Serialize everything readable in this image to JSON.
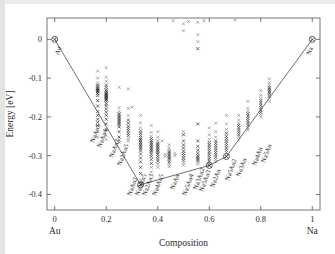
{
  "figure": {
    "background": "#ffffff",
    "frame_color": "#55555a",
    "marker_color": "#6e6e74",
    "hull_color": "#4a4a50"
  },
  "chart_data": {
    "type": "scatter",
    "title": "",
    "xlabel": "Composition",
    "ylabel": "Energy [eV]",
    "xlim": [
      -0.03,
      1.03
    ],
    "ylim": [
      -0.44,
      0.055
    ],
    "grid": false,
    "legend": null,
    "xticks": [
      0,
      0.2,
      0.4,
      0.6,
      0.8,
      1
    ],
    "xtick_labels": [
      "0",
      "0.2",
      "0.4",
      "0.6",
      "0.8",
      "1"
    ],
    "yticks": [
      0,
      -0.1,
      -0.2,
      -0.3,
      -0.4
    ],
    "ytick_labels": [
      "0",
      "-0.1",
      "-0.2",
      "-0.3",
      "-0.4"
    ],
    "x_end_labels": {
      "left": "Au",
      "right": "Na"
    },
    "series": [
      {
        "name": "convex hull",
        "type": "line",
        "x": [
          0.0,
          0.3333,
          0.6,
          0.6667,
          1.0
        ],
        "y": [
          0.0,
          -0.375,
          -0.325,
          -0.302,
          0.0
        ]
      },
      {
        "name": "hull vertices",
        "type": "marker-circle",
        "x": [
          0.0,
          0.3333,
          0.6,
          0.6667,
          1.0
        ],
        "y": [
          0.0,
          -0.375,
          -0.325,
          -0.302,
          0.0
        ],
        "labels": [
          "Au",
          "NaAu2",
          "Na3Au2",
          "Na2Au",
          "Na"
        ]
      },
      {
        "name": "structure energies",
        "type": "marker-x",
        "clusters": [
          {
            "x": 0.1667,
            "label": "NaAu5",
            "values": [
              -0.082,
              -0.1,
              -0.112,
              -0.118,
              -0.122,
              -0.126,
              -0.128,
              -0.13,
              -0.132,
              -0.134,
              -0.136,
              -0.14,
              -0.145,
              -0.158,
              -0.172,
              -0.186,
              -0.196,
              -0.206,
              -0.214,
              -0.222,
              -0.238,
              -0.252
            ]
          },
          {
            "x": 0.2,
            "label": "NaAu4",
            "values": [
              -0.073,
              -0.098,
              -0.108,
              -0.118,
              -0.124,
              -0.13,
              -0.134,
              -0.138,
              -0.14,
              -0.142,
              -0.144,
              -0.146,
              -0.148,
              -0.15,
              -0.152,
              -0.154,
              -0.156,
              -0.16,
              -0.166,
              -0.172,
              -0.18,
              -0.188,
              -0.196,
              -0.206,
              -0.218,
              -0.232,
              -0.248,
              -0.258
            ]
          },
          {
            "x": 0.25,
            "label": "NaAu3",
            "values": [
              -0.124,
              -0.176,
              -0.186,
              -0.192,
              -0.196,
              -0.2,
              -0.204,
              -0.208,
              -0.212,
              -0.216,
              -0.22,
              -0.226,
              -0.238,
              -0.252,
              -0.26,
              -0.266
            ]
          },
          {
            "x": 0.2857,
            "label": "Na2Au5",
            "values": [
              -0.128,
              -0.178,
              -0.196,
              -0.208,
              -0.216,
              -0.224,
              -0.23,
              -0.236,
              -0.242,
              -0.248,
              -0.256,
              -0.262
            ]
          },
          {
            "x": 0.3333,
            "label": "NaAu2",
            "values": [
              -0.196,
              -0.216,
              -0.228,
              -0.236,
              -0.242,
              -0.248,
              -0.254,
              -0.258,
              -0.262,
              -0.266,
              -0.27,
              -0.274,
              -0.278,
              -0.282,
              -0.288,
              -0.296,
              -0.306,
              -0.316,
              -0.33,
              -0.346,
              -0.362,
              -0.375
            ]
          },
          {
            "x": 0.375,
            "label": "Na3Au5",
            "values": [
              -0.222,
              -0.24,
              -0.25,
              -0.256,
              -0.262,
              -0.266,
              -0.27,
              -0.274,
              -0.278,
              -0.282,
              -0.286,
              -0.29,
              -0.296,
              -0.302,
              -0.31,
              -0.32,
              -0.33,
              -0.342
            ]
          },
          {
            "x": 0.4,
            "label": "Na2Au3",
            "values": [
              -0.238,
              -0.252,
              -0.262,
              -0.268,
              -0.272,
              -0.276,
              -0.28,
              -0.284,
              -0.288,
              -0.292,
              -0.296,
              -0.302,
              -0.308,
              -0.314,
              -0.322,
              -0.33
            ]
          },
          {
            "x": 0.4444,
            "label": "Na4Au5",
            "values": [
              -0.272,
              -0.28,
              -0.286,
              -0.29,
              -0.294,
              -0.298,
              -0.302,
              -0.306,
              -0.31,
              -0.316,
              -0.322,
              -0.328
            ]
          },
          {
            "x": 0.5,
            "label": "NaAu",
            "values": [
              0.04,
              0.022,
              -0.238,
              -0.246,
              -0.262,
              -0.272,
              -0.28,
              -0.288,
              -0.294,
              -0.3,
              -0.306,
              -0.312,
              -0.318,
              -0.324
            ]
          },
          {
            "x": 0.5556,
            "label": "Na5Au4",
            "values": [
              0.044,
              0.012,
              -0.006,
              -0.024,
              -0.218,
              -0.262,
              -0.276,
              -0.286,
              -0.294,
              -0.3,
              -0.304,
              -0.308,
              -0.312,
              -0.316,
              -0.322
            ]
          },
          {
            "x": 0.6,
            "label": "Na3Au2",
            "values": [
              -0.228,
              -0.246,
              -0.258,
              -0.266,
              -0.272,
              -0.278,
              -0.284,
              -0.29,
              -0.296,
              -0.302,
              -0.308,
              -0.314,
              -0.32,
              -0.325
            ]
          },
          {
            "x": 0.625,
            "label": "Na5Au3",
            "values": [
              -0.216,
              -0.238,
              -0.252,
              -0.262,
              -0.268,
              -0.274,
              -0.28,
              -0.286,
              -0.292,
              -0.298,
              -0.304,
              -0.31,
              -0.316
            ]
          },
          {
            "x": 0.6667,
            "label": "Na2Au",
            "values": [
              -0.196,
              -0.218,
              -0.232,
              -0.242,
              -0.25,
              -0.256,
              -0.262,
              -0.268,
              -0.274,
              -0.28,
              -0.286,
              -0.292,
              -0.302
            ]
          },
          {
            "x": 0.7143,
            "label": "Na5Au2",
            "values": [
              -0.196,
              -0.208,
              -0.216,
              -0.222,
              -0.228,
              -0.234,
              -0.24,
              -0.246,
              -0.252,
              -0.258
            ]
          },
          {
            "x": 0.75,
            "label": "Na3Au",
            "values": [
              -0.16,
              -0.178,
              -0.186,
              -0.192,
              -0.198,
              -0.204,
              -0.21,
              -0.216,
              -0.222,
              -0.228,
              -0.234
            ]
          },
          {
            "x": 0.8,
            "label": "Na4Au",
            "values": [
              -0.132,
              -0.144,
              -0.152,
              -0.158,
              -0.164,
              -0.17,
              -0.176,
              -0.182,
              -0.188,
              -0.194,
              -0.2
            ]
          },
          {
            "x": 0.8333,
            "label": "Na5Au",
            "values": [
              -0.102,
              -0.112,
              -0.118,
              -0.124,
              -0.128,
              -0.132,
              -0.136,
              -0.14,
              -0.146,
              -0.152,
              -0.16
            ]
          },
          {
            "x": 0.3,
            "label": "",
            "values": [
              -0.175
            ]
          },
          {
            "x": 0.4167,
            "label": "",
            "values": [
              -0.262
            ]
          },
          {
            "x": 0.4286,
            "label": "",
            "values": [
              -0.296,
              -0.302
            ]
          },
          {
            "x": 0.4667,
            "label": "",
            "values": [
              -0.294,
              -0.3
            ]
          },
          {
            "x": 0.52,
            "label": "",
            "values": [
              0.046
            ]
          },
          {
            "x": 0.58,
            "label": "",
            "values": [
              0.048
            ]
          },
          {
            "x": 0.7,
            "label": "",
            "values": [
              0.05
            ]
          },
          {
            "x": 0.46,
            "label": "",
            "values": [
              0.048
            ]
          }
        ]
      }
    ],
    "phase_labels": [
      "NaAu5",
      "NaAu4",
      "NaAu3",
      "Na2Au5",
      "NaAu2",
      "Na3Au5",
      "Na2Au3",
      "Na4Au5",
      "NaAu",
      "Na5Au4",
      "Na3Au2",
      "Na5Au3",
      "Na2Au",
      "Na5Au2",
      "Na3Au",
      "Na4Au",
      "Na5Au"
    ]
  }
}
